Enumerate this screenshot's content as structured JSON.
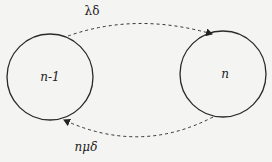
{
  "diagram": {
    "nodes": [
      {
        "id": "n-minus-1",
        "label": "n-1"
      },
      {
        "id": "n",
        "label": "n"
      }
    ],
    "edges": [
      {
        "from": "n-minus-1",
        "to": "n",
        "label": "λδ",
        "style": "dashed"
      },
      {
        "from": "n",
        "to": "n-minus-1",
        "label": "nμδ",
        "style": "dashed"
      }
    ],
    "colors": {
      "stroke": "#2a2a2a",
      "background": "#f4f4f2"
    }
  }
}
